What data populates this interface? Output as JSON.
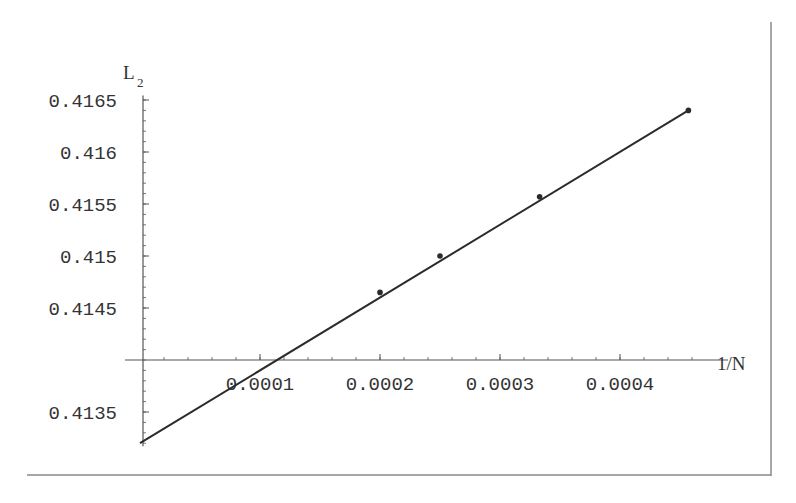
{
  "chart_data": {
    "type": "line",
    "title": "",
    "xlabel": "1/N",
    "ylabel": "L_2",
    "ylabel_main": "L",
    "ylabel_sub": "2",
    "xlim": [
      0,
      0.00046
    ],
    "ylim": [
      0.4132,
      0.4166
    ],
    "axes_origin": {
      "x": 0,
      "y": 0.414
    },
    "x_ticks": [
      {
        "value": 0.0001,
        "label": "0.0001"
      },
      {
        "value": 0.0002,
        "label": "0.0002"
      },
      {
        "value": 0.0003,
        "label": "0.0003"
      },
      {
        "value": 0.0004,
        "label": "0.0004"
      }
    ],
    "y_ticks": [
      {
        "value": 0.4165,
        "label": "0.4165"
      },
      {
        "value": 0.416,
        "label": "0.416"
      },
      {
        "value": 0.4155,
        "label": "0.4155"
      },
      {
        "value": 0.415,
        "label": "0.415"
      },
      {
        "value": 0.4145,
        "label": "0.4145"
      },
      {
        "value": 0.4135,
        "label": "0.4135"
      }
    ],
    "series": [
      {
        "name": "linear fit",
        "style": "line",
        "x": [
          0,
          0.000457
        ],
        "y": [
          0.4132,
          0.4164
        ]
      },
      {
        "name": "data points",
        "style": "markers",
        "x": [
          0.0002,
          0.00025,
          0.000333,
          0.000457
        ],
        "y": [
          0.41465,
          0.415,
          0.41557,
          0.4164
        ]
      }
    ],
    "grid": false,
    "legend": null,
    "colors": {
      "line": "#2b2b2b",
      "axis": "#555555",
      "frame": "#888888"
    }
  }
}
